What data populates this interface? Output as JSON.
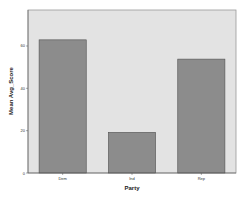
{
  "chart_data": {
    "type": "bar",
    "title": "",
    "xlabel": "Party",
    "ylabel": "Mean Avg_Score",
    "categories": [
      "Dem",
      "Ind",
      "Rep"
    ],
    "values": [
      62.9,
      19.2,
      53.8
    ],
    "yticks": [
      0,
      20,
      40,
      60
    ],
    "ylim": [
      0,
      77
    ],
    "grid": false,
    "legend": null
  },
  "colors": {
    "plot_background": "#e3e3e3",
    "bar_fill": "#8c8c8c",
    "bar_outline": "#505050",
    "frame": "#9a9a9a"
  }
}
